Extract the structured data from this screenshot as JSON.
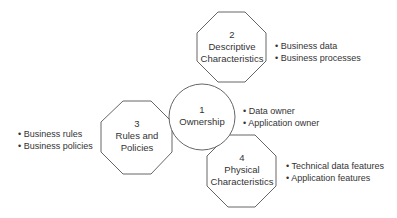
{
  "nodes": [
    {
      "number": "1",
      "title": "Ownership",
      "shape": "circle",
      "bullets": [
        "Data owner",
        "Application owner"
      ]
    },
    {
      "number": "2",
      "title": "Descriptive Characteristics",
      "shape": "octagon",
      "title_lines": [
        "Descriptive",
        "Characteristics"
      ],
      "bullets": [
        "Business data",
        "Business processes"
      ]
    },
    {
      "number": "3",
      "title": "Rules and Policies",
      "shape": "octagon",
      "title_lines": [
        "Rules and",
        "Policies"
      ],
      "bullets": [
        "Business rules",
        "Business policies"
      ]
    },
    {
      "number": "4",
      "title": "Physical Characteristics",
      "shape": "octagon",
      "title_lines": [
        "Physical",
        "Characteristics"
      ],
      "bullets": [
        "Technical data features",
        "Application features"
      ]
    }
  ],
  "colors": {
    "stroke": "#555555",
    "text": "#333333",
    "background": "#ffffff"
  }
}
